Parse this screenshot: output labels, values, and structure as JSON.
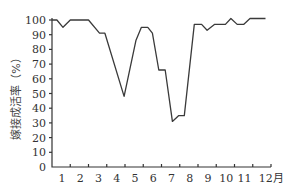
{
  "chart_data": {
    "type": "line",
    "title": "",
    "xlabel": "月",
    "ylabel": "嫁接成活率（%）",
    "ylim": [
      0,
      100
    ],
    "xlim": [
      0,
      12
    ],
    "grid": false,
    "legend": null,
    "yticks": [
      0,
      10,
      20,
      30,
      40,
      50,
      60,
      70,
      80,
      90,
      100
    ],
    "xtick_labels": [
      "1",
      "2",
      "3",
      "4",
      "5",
      "6",
      "7",
      "8",
      "9",
      "10",
      "11",
      "12月"
    ],
    "series": [
      {
        "name": "嫁接成活率",
        "points": [
          [
            0.0,
            100
          ],
          [
            0.27,
            100
          ],
          [
            0.6,
            95
          ],
          [
            1.0,
            100
          ],
          [
            2.0,
            100
          ],
          [
            2.6,
            91
          ],
          [
            2.9,
            91
          ],
          [
            3.95,
            48
          ],
          [
            4.6,
            86
          ],
          [
            4.9,
            95
          ],
          [
            5.25,
            95
          ],
          [
            5.5,
            91
          ],
          [
            5.85,
            66
          ],
          [
            6.2,
            66
          ],
          [
            6.6,
            31
          ],
          [
            6.95,
            35
          ],
          [
            7.25,
            35
          ],
          [
            7.8,
            97
          ],
          [
            8.2,
            97
          ],
          [
            8.5,
            93
          ],
          [
            8.9,
            97
          ],
          [
            9.5,
            97
          ],
          [
            9.8,
            101
          ],
          [
            10.15,
            97
          ],
          [
            10.5,
            97
          ],
          [
            10.85,
            101
          ],
          [
            11.7,
            101
          ]
        ]
      }
    ]
  }
}
